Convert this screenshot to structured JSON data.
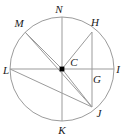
{
  "figure": {
    "kind": "circle-geometry-diagram",
    "width": 123,
    "height": 138,
    "background_color": "#ffffff",
    "stroke_color": "#9b9b9b",
    "label_color": "#1a1a1a",
    "center_dot_color": "#000000",
    "circle": {
      "center_x": 62,
      "center_y": 69,
      "radius": 52
    },
    "center_point": {
      "name": "C",
      "label": "C",
      "x": 62,
      "y": 69,
      "label_x": 74,
      "label_y": 62
    },
    "points": [
      {
        "name": "N",
        "label": "N",
        "x": 62,
        "y": 17,
        "label_x": 59,
        "label_y": 9,
        "on_circle": true
      },
      {
        "name": "M",
        "label": "M",
        "x": 25,
        "y": 32,
        "label_x": 19,
        "label_y": 23,
        "on_circle": true
      },
      {
        "name": "H",
        "label": "H",
        "x": 92,
        "y": 32,
        "label_x": 95,
        "label_y": 22,
        "on_circle": true
      },
      {
        "name": "L",
        "label": "L",
        "x": 10,
        "y": 69,
        "label_x": 6,
        "label_y": 70,
        "on_circle": true
      },
      {
        "name": "I",
        "label": "I",
        "x": 114,
        "y": 69,
        "label_x": 118,
        "label_y": 69,
        "on_circle": true
      },
      {
        "name": "G",
        "label": "G",
        "x": 92,
        "y": 69,
        "label_x": 97,
        "label_y": 79,
        "on_circle": false
      },
      {
        "name": "J",
        "label": "J",
        "x": 92,
        "y": 107,
        "label_x": 99,
        "label_y": 113,
        "on_circle": true
      },
      {
        "name": "K",
        "label": "K",
        "x": 62,
        "y": 121,
        "label_x": 62,
        "label_y": 130,
        "on_circle": true
      }
    ],
    "segments": [
      {
        "name": "diameter-LI",
        "from": "L",
        "to": "I",
        "x1": 10,
        "y1": 69,
        "x2": 114,
        "y2": 69
      },
      {
        "name": "diameter-NK",
        "from": "N",
        "to": "K",
        "x1": 62,
        "y1": 17,
        "x2": 62,
        "y2": 121
      },
      {
        "name": "radius-CM",
        "from": "C",
        "to": "M",
        "x1": 62,
        "y1": 69,
        "x2": 25,
        "y2": 32
      },
      {
        "name": "radius-CH",
        "from": "C",
        "to": "H",
        "x1": 62,
        "y1": 69,
        "x2": 92,
        "y2": 32
      },
      {
        "name": "radius-CJ",
        "from": "C",
        "to": "J",
        "x1": 62,
        "y1": 69,
        "x2": 92,
        "y2": 107
      },
      {
        "name": "chord-LJ",
        "from": "L",
        "to": "J",
        "x1": 10,
        "y1": 69,
        "x2": 92,
        "y2": 107
      },
      {
        "name": "chord-HJ",
        "from": "H",
        "to": "J",
        "x1": 92,
        "y1": 32,
        "x2": 92,
        "y2": 107
      },
      {
        "name": "chord-MJ",
        "from": "M",
        "to": "J",
        "x1": 25,
        "y1": 32,
        "x2": 92,
        "y2": 107
      }
    ]
  }
}
